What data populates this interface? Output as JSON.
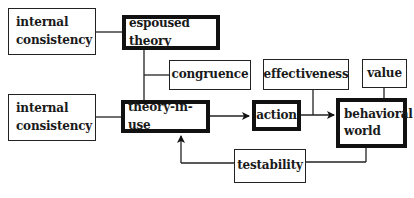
{
  "diagram": {
    "title": "",
    "nodes": [
      {
        "id": "internal_consistency_1",
        "label": "internal consistency",
        "line1": "internal",
        "line2": "consistency",
        "style": "thin"
      },
      {
        "id": "espoused_theory",
        "label": "espoused theory",
        "style": "thick"
      },
      {
        "id": "congruence",
        "label": "congruence",
        "style": "thin"
      },
      {
        "id": "internal_consistency_2",
        "label": "internal consistency",
        "line1": "internal",
        "line2": "consistency",
        "style": "thin"
      },
      {
        "id": "theory_in_use",
        "label": "theory-in-use",
        "style": "thick"
      },
      {
        "id": "action",
        "label": "action",
        "style": "thick"
      },
      {
        "id": "effectiveness",
        "label": "effectiveness",
        "style": "thin"
      },
      {
        "id": "value",
        "label": "value",
        "style": "thin"
      },
      {
        "id": "behavioral_world",
        "label": "behavioral world",
        "line1": "behavioral",
        "line2": "world",
        "style": "thick"
      },
      {
        "id": "testability",
        "label": "testability",
        "style": "thin"
      }
    ],
    "edges": [
      {
        "from": "internal_consistency_1",
        "to": "espoused_theory",
        "type": "line"
      },
      {
        "from": "espoused_theory",
        "to": "theory_in_use",
        "type": "line"
      },
      {
        "from": "congruence",
        "to": "espoused_theory-theory_in_use",
        "type": "line"
      },
      {
        "from": "internal_consistency_2",
        "to": "theory_in_use",
        "type": "line"
      },
      {
        "from": "theory_in_use",
        "to": "action",
        "type": "arrow"
      },
      {
        "from": "action",
        "to": "behavioral_world",
        "type": "arrow"
      },
      {
        "from": "effectiveness",
        "to": "action-behavioral_world",
        "type": "line"
      },
      {
        "from": "value",
        "to": "behavioral_world",
        "type": "line"
      },
      {
        "from": "behavioral_world",
        "to": "testability",
        "type": "line"
      },
      {
        "from": "testability",
        "to": "theory_in_use",
        "type": "arrow"
      }
    ]
  }
}
